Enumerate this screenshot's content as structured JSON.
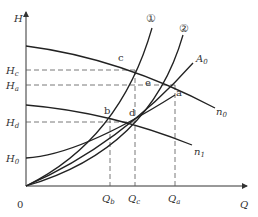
{
  "diagram": {
    "type": "pump-performance-curves",
    "axes": {
      "y_label": "H",
      "x_label": "Q",
      "origin_label": "0"
    },
    "y_ticks": [
      {
        "main": "H",
        "sub": "c"
      },
      {
        "main": "H",
        "sub": "a"
      },
      {
        "main": "H",
        "sub": "d"
      },
      {
        "main": "H",
        "sub": "0"
      }
    ],
    "x_ticks": [
      {
        "main": "Q",
        "sub": "b"
      },
      {
        "main": "Q",
        "sub": "c"
      },
      {
        "main": "Q",
        "sub": "a"
      }
    ],
    "curves": [
      {
        "id": "n0",
        "main": "n",
        "sub": "0",
        "kind": "pump head curve at speed n0"
      },
      {
        "id": "n1",
        "main": "n",
        "sub": "1",
        "kind": "pump head curve at speed n1"
      },
      {
        "id": "system-1",
        "label": "①",
        "kind": "system curve 1"
      },
      {
        "id": "system-2",
        "label": "②",
        "kind": "system curve 2"
      },
      {
        "id": "A0",
        "main": "A",
        "sub": "0",
        "kind": "similar-operating-point parabola"
      },
      {
        "id": "H0",
        "kind": "system curve with static head H0"
      }
    ],
    "points": [
      "a",
      "b",
      "c",
      "d",
      "e"
    ]
  }
}
